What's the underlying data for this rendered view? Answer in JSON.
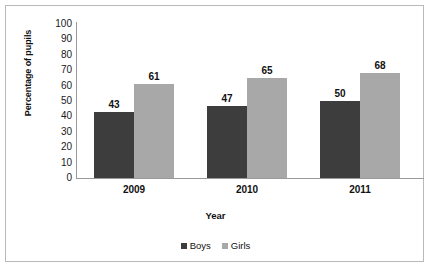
{
  "chart_data": {
    "type": "bar",
    "title": "",
    "xlabel": "Year",
    "ylabel": "Percentage of pupils",
    "categories": [
      "2009",
      "2010",
      "2011"
    ],
    "series": [
      {
        "name": "Boys",
        "color": "#3d3d3d",
        "values": [
          43,
          47,
          50
        ]
      },
      {
        "name": "Girls",
        "color": "#a8a8a8",
        "values": [
          61,
          65,
          68
        ]
      }
    ],
    "ylim": [
      0,
      100
    ],
    "ytick_step": 10,
    "yticks": [
      "100",
      "90",
      "80",
      "70",
      "60",
      "50",
      "40",
      "30",
      "20",
      "10",
      "0"
    ],
    "grid": false,
    "legend_position": "bottom",
    "data_labels": true
  },
  "frame": {
    "border_color": "#b9b9b9",
    "background": "#ffffff"
  },
  "axis": {
    "line_color": "#9a9a9a"
  }
}
